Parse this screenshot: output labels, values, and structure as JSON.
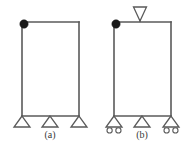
{
  "figure": {
    "panels": [
      {
        "id": "a",
        "caption": "(a)",
        "caption_x": 50,
        "caption_y": 136,
        "frame": {
          "left_x": 22,
          "right_x": 79,
          "top_y": 22,
          "bottom_y": 116
        },
        "mass": {
          "label": "lumped-mass",
          "cx": 24,
          "cy": 24,
          "r": 4.2,
          "color": "#1a1a1a"
        },
        "load": null,
        "supports": [
          {
            "type": "pinned",
            "x": 22,
            "label": "pinned-support-left"
          },
          {
            "type": "pinned",
            "x": 50,
            "label": "pinned-support-middle"
          },
          {
            "type": "pinned",
            "x": 79,
            "label": "pinned-support-right"
          }
        ]
      },
      {
        "id": "b",
        "caption": "(b)",
        "caption_x": 142,
        "caption_y": 136,
        "frame": {
          "left_x": 114,
          "right_x": 171,
          "top_y": 22,
          "bottom_y": 116
        },
        "mass": {
          "label": "lumped-mass",
          "cx": 116,
          "cy": 24,
          "r": 4.2,
          "color": "#1a1a1a"
        },
        "load": {
          "label": "applied-load-marker",
          "x": 140,
          "apex_y": 21,
          "top_y": 7,
          "half_width": 6.5
        },
        "supports": [
          {
            "type": "roller",
            "x": 114,
            "label": "roller-support-left"
          },
          {
            "type": "pinned",
            "x": 142,
            "label": "pinned-support-middle"
          },
          {
            "type": "roller",
            "x": 171,
            "label": "roller-support-right"
          }
        ]
      }
    ],
    "support_geometry": {
      "triangle_height": 11,
      "triangle_half_width": 8,
      "wheel_radius": 2.6,
      "wheel_offset_x": 4.4,
      "wheel_offset_y": 3.4
    },
    "colors": {
      "line": "#5a5a5a",
      "mass": "#1a1a1a",
      "background": "#ffffff",
      "caption": "#3a3a3a"
    }
  }
}
